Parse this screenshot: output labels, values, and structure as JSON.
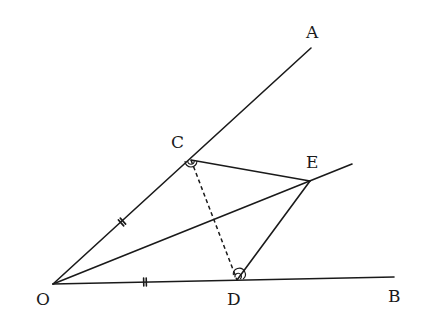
{
  "diagram": {
    "type": "geometry",
    "stroke_color": "#1a1a1a",
    "background": "#ffffff",
    "points": {
      "O": {
        "label": "O",
        "x": 53,
        "y": 284,
        "lx": 36,
        "ly": 305
      },
      "A": {
        "label": "A",
        "x": 311,
        "y": 48,
        "lx": 306,
        "ly": 38
      },
      "B": {
        "label": "B",
        "x": 394,
        "y": 277,
        "lx": 388,
        "ly": 302
      },
      "C": {
        "label": "C",
        "x": 191,
        "y": 160,
        "lx": 171,
        "ly": 148
      },
      "D": {
        "label": "D",
        "x": 237,
        "y": 280,
        "lx": 227,
        "ly": 305
      },
      "E": {
        "label": "E",
        "x": 310,
        "y": 181,
        "lx": 306,
        "ly": 168
      }
    },
    "segments": [
      {
        "name": "ray-OA",
        "from": [
          53,
          284
        ],
        "to": [
          311,
          48
        ],
        "style": "solid"
      },
      {
        "name": "ray-OB",
        "from": [
          53,
          284
        ],
        "to": [
          394,
          277
        ],
        "style": "solid"
      },
      {
        "name": "ray-OE",
        "from": [
          53,
          284
        ],
        "to": [
          352,
          164
        ],
        "style": "solid"
      },
      {
        "name": "segment-CE",
        "from": [
          191,
          160
        ],
        "to": [
          310,
          181
        ],
        "style": "solid"
      },
      {
        "name": "segment-DE",
        "from": [
          237,
          280
        ],
        "to": [
          310,
          181
        ],
        "style": "solid"
      },
      {
        "name": "segment-CD",
        "from": [
          191,
          160
        ],
        "to": [
          237,
          280
        ],
        "style": "dashed"
      }
    ],
    "equal_marks": [
      {
        "segment": "OC",
        "marks": 2
      },
      {
        "segment": "OD",
        "marks": 2
      }
    ],
    "angle_marks": [
      {
        "vertex": "C",
        "arcs": 2,
        "angle": "OCE"
      },
      {
        "vertex": "D",
        "arcs": 2,
        "angle": "EDB"
      }
    ]
  }
}
